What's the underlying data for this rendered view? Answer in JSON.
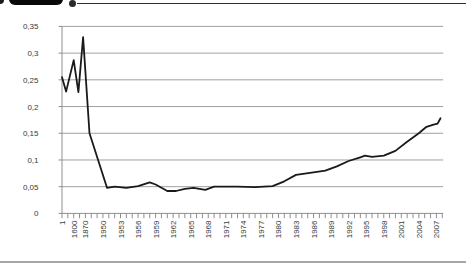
{
  "figure": {
    "header": {
      "pill_color": "#080808",
      "leader_line_color": "#2e2e2e",
      "note": "black label pill cropped at top edge with leader dot and rule"
    },
    "bottom_rule_color": "#a6a6a6"
  },
  "chart_data": {
    "type": "line",
    "title": "",
    "xlabel": "",
    "ylabel": "",
    "legend": "none",
    "grid": "horizontal",
    "ylim": [
      0,
      0.35
    ],
    "y_tick_step": 0.05,
    "y_tick_labels": [
      "0",
      "0,05",
      "0,1",
      "0,15",
      "0,2",
      "0,25",
      "0,3",
      "0,35"
    ],
    "x_tick_labels": [
      "1",
      "1600",
      "1870",
      "1950",
      "1953",
      "1956",
      "1959",
      "1962",
      "1965",
      "1968",
      "1971",
      "1974",
      "1977",
      "1980",
      "1983",
      "1986",
      "1989",
      "1992",
      "1995",
      "1998",
      "2001",
      "2004",
      "2007"
    ],
    "x_label_tick_indices": [
      0,
      2,
      4,
      7,
      10,
      13,
      16,
      19,
      22,
      25,
      28,
      31,
      34,
      37,
      40,
      43,
      46,
      49,
      52,
      55,
      58,
      61,
      64
    ],
    "x_minor_tick_count": 66,
    "x_axis_note": "t = minor tick index; ticks 0,2,4 correspond to labels 1, 1600, 1870; ticks 7..65 are yearly 1950..2008; labels shown every 3rd tick",
    "series": [
      {
        "name": "ratio",
        "color": "#1a1a1a",
        "points": [
          [
            0,
            0.255
          ],
          [
            0.7,
            0.228
          ],
          [
            2,
            0.287
          ],
          [
            2.8,
            0.227
          ],
          [
            3.6,
            0.33
          ],
          [
            4.7,
            0.15
          ],
          [
            7.7,
            0.048
          ],
          [
            9,
            0.05
          ],
          [
            11,
            0.048
          ],
          [
            13,
            0.051
          ],
          [
            15,
            0.058
          ],
          [
            16,
            0.054
          ],
          [
            18,
            0.042
          ],
          [
            19.5,
            0.042
          ],
          [
            21,
            0.046
          ],
          [
            22.5,
            0.048
          ],
          [
            24.5,
            0.044
          ],
          [
            26,
            0.05
          ],
          [
            30,
            0.05
          ],
          [
            33,
            0.049
          ],
          [
            36,
            0.051
          ],
          [
            38,
            0.06
          ],
          [
            40,
            0.072
          ],
          [
            43,
            0.077
          ],
          [
            45,
            0.08
          ],
          [
            47,
            0.088
          ],
          [
            49,
            0.098
          ],
          [
            51,
            0.105
          ],
          [
            51.8,
            0.108
          ],
          [
            53,
            0.106
          ],
          [
            55,
            0.108
          ],
          [
            57,
            0.117
          ],
          [
            59,
            0.134
          ],
          [
            61,
            0.15
          ],
          [
            62.3,
            0.162
          ],
          [
            63.5,
            0.166
          ],
          [
            64.2,
            0.168
          ],
          [
            64.7,
            0.178
          ]
        ]
      }
    ],
    "colors": {
      "gridline": "#a0a0a0",
      "axis": "#8f8f8f",
      "tick_label": "#3a3a3a",
      "series": "#1a1a1a"
    }
  }
}
